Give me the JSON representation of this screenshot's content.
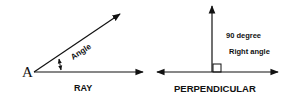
{
  "ray_figure": {
    "point_label": "A",
    "angle_label": "Angle",
    "caption": "RAY"
  },
  "perpendicular_figure": {
    "line1": "90 degree",
    "line2": "Right angle",
    "caption": "PERPENDICULAR"
  },
  "colors": {
    "stroke": "#111111",
    "background": "#ffffff"
  }
}
